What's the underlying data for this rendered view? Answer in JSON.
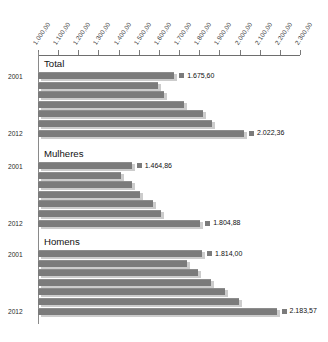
{
  "chart_data": {
    "type": "bar",
    "orientation": "horizontal",
    "title": "",
    "xlabel": "",
    "ylabel": "",
    "xlim": [
      1000,
      2300
    ],
    "grid": false,
    "legend": "none",
    "tick_labels": [
      "1.000,00",
      "1.100,00",
      "1.200,00",
      "1.300,00",
      "1.400,00",
      "1.500,00",
      "1.600,00",
      "1.700,00",
      "1.800,00",
      "1.900,00",
      "2.000,00",
      "2.100,00",
      "2.200,00",
      "2.300,00"
    ],
    "tick_values": [
      1000,
      1100,
      1200,
      1300,
      1400,
      1500,
      1600,
      1700,
      1800,
      1900,
      2000,
      2100,
      2200,
      2300
    ],
    "categories": [
      "2001",
      "",
      "",
      "",
      "",
      "",
      "2012"
    ],
    "panels": [
      {
        "name": "Total",
        "categories": [
          "2001",
          "",
          "",
          "",
          "",
          "",
          "2012"
        ],
        "values": [
          1675.6,
          1595.0,
          1627.0,
          1723.0,
          1820.0,
          1862.0,
          2022.36
        ],
        "labels": [
          {
            "index": 0,
            "text": "1.675,60"
          },
          {
            "index": 6,
            "text": "2.022,36"
          }
        ]
      },
      {
        "name": "Mulheres",
        "categories": [
          "2001",
          "",
          "",
          "",
          "",
          "",
          "2012"
        ],
        "values": [
          1464.86,
          1413.0,
          1464.0,
          1507.0,
          1570.0,
          1612.0,
          1804.88
        ],
        "labels": [
          {
            "index": 0,
            "text": "1.464,86"
          },
          {
            "index": 6,
            "text": "1.804,88"
          }
        ]
      },
      {
        "name": "Homens",
        "categories": [
          "2001",
          "",
          "",
          "",
          "",
          "",
          "2012"
        ],
        "values": [
          1814.0,
          1740.0,
          1794.0,
          1860.0,
          1928.0,
          1995.0,
          2183.57
        ],
        "labels": [
          {
            "index": 0,
            "text": "1.814,00"
          },
          {
            "index": 6,
            "text": "2.183,57"
          }
        ]
      }
    ],
    "colors": {
      "bar": "#7b7b7b",
      "shadow": "#cccccc",
      "axis": "#7a7a7a",
      "text": "#111111"
    }
  },
  "caption": ""
}
